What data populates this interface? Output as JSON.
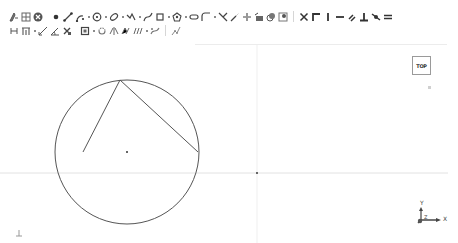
{
  "toolbar": {
    "row1": [
      {
        "icon": "sketch-tool-icon",
        "label": "Sketch"
      },
      {
        "icon": "grid-icon",
        "label": "Grid"
      },
      {
        "icon": "close-sketch-icon",
        "label": "Close sketch"
      },
      {
        "sep": "gap"
      },
      {
        "icon": "point-icon",
        "label": "Point"
      },
      {
        "icon": "line-icon",
        "label": "Line"
      },
      {
        "icon": "arc-icon",
        "label": "Arc"
      },
      {
        "sep": "dot"
      },
      {
        "icon": "circle-icon",
        "label": "Circle"
      },
      {
        "sep": "dot"
      },
      {
        "icon": "ellipse-icon",
        "label": "Ellipse"
      },
      {
        "sep": "dot"
      },
      {
        "icon": "polyline-icon",
        "label": "Polyline"
      },
      {
        "sep": "dot"
      },
      {
        "icon": "bspline-icon",
        "label": "B-spline"
      },
      {
        "icon": "rectangle-icon",
        "label": "Rectangle"
      },
      {
        "sep": "dot"
      },
      {
        "icon": "polygon-icon",
        "label": "Polygon"
      },
      {
        "sep": "dot"
      },
      {
        "icon": "slot-icon",
        "label": "Slot"
      },
      {
        "icon": "fillet-icon",
        "label": "Fillet"
      },
      {
        "sep": "dot"
      },
      {
        "icon": "trim-icon",
        "label": "Trim"
      },
      {
        "icon": "extend-icon",
        "label": "Extend"
      },
      {
        "icon": "split-icon",
        "label": "Split"
      },
      {
        "icon": "external-geometry-icon",
        "label": "External geometry"
      },
      {
        "icon": "carbon-copy-icon",
        "label": "Carbon copy"
      },
      {
        "icon": "construction-mode-icon",
        "label": "Construction mode"
      },
      {
        "sep": "divider"
      },
      {
        "icon": "constrain-coincident-icon",
        "label": "Coincident"
      },
      {
        "icon": "constrain-point-on-object-icon",
        "label": "Point on object"
      },
      {
        "icon": "constrain-vertical-icon",
        "label": "Vertical"
      },
      {
        "icon": "constrain-horizontal-icon",
        "label": "Horizontal"
      },
      {
        "icon": "constrain-parallel-icon",
        "label": "Parallel"
      },
      {
        "icon": "constrain-perpendicular-icon",
        "label": "Perpendicular"
      },
      {
        "icon": "constrain-tangent-icon",
        "label": "Tangent"
      },
      {
        "icon": "constrain-equal-icon",
        "label": "Equal"
      }
    ],
    "row2": [
      {
        "icon": "constrain-symmetric-icon",
        "label": "Symmetric"
      },
      {
        "icon": "constrain-block-icon",
        "label": "Block"
      },
      {
        "sep": "dot"
      },
      {
        "icon": "constrain-distance-icon",
        "label": "Distance"
      },
      {
        "icon": "constrain-angle-icon",
        "label": "Angle"
      },
      {
        "icon": "toggle-driving-icon",
        "label": "Toggle driving"
      },
      {
        "sep": "gap"
      },
      {
        "icon": "select-elements-icon",
        "label": "Select elements"
      },
      {
        "sep": "dot"
      },
      {
        "icon": "show-hide-icon",
        "label": "Show/hide"
      },
      {
        "icon": "symmetry-icon",
        "label": "Symmetry"
      },
      {
        "icon": "clone-icon",
        "label": "Clone"
      },
      {
        "icon": "rectangular-array-icon",
        "label": "Rectangular array"
      },
      {
        "sep": "dot"
      },
      {
        "icon": "bspline-tools-icon",
        "label": "B-spline tools"
      },
      {
        "sep": "divider"
      },
      {
        "icon": "virtual-space-icon",
        "label": "Virtual space"
      }
    ]
  },
  "canvas": {
    "viewcube": {
      "label": "TOP"
    },
    "triad": {
      "x_label": "X",
      "y_label": "Y",
      "z_label": "Z"
    },
    "geometry": {
      "circle": {
        "cx": 127,
        "cy": 152,
        "r": 72
      },
      "center_point": {
        "x": 127,
        "y": 152
      },
      "lines": [
        {
          "x1": 83,
          "y1": 152,
          "x2": 120,
          "y2": 80
        },
        {
          "x1": 120,
          "y1": 80,
          "x2": 198,
          "y2": 152
        }
      ],
      "origin": {
        "x": 257,
        "y": 173
      }
    },
    "colors": {
      "geometry": "#555555",
      "axis": "#e2e2e2",
      "background": "#ffffff"
    }
  }
}
